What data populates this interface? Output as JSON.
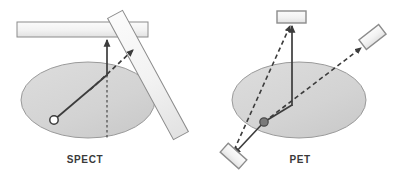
{
  "figure": {
    "title_spect": "SPECT",
    "title_pet": "PET",
    "width": 397,
    "height": 176,
    "background": "#ffffff"
  },
  "colors": {
    "phantom_fill": "#d3d3d3",
    "phantom_stroke": "#9a9a9a",
    "detector_fill": "#f0f0f0",
    "detector_stroke": "#8c8c8c",
    "ray_solid": "#3c3c3c",
    "ray_dashed": "#3c3c3c",
    "source_open_stroke": "#3c3c3c",
    "source_filled": "#6e6e6e",
    "label_text": "#3a3a3a"
  },
  "panels": {
    "spect": {
      "label": "SPECT",
      "label_x": 85,
      "label_y": 163,
      "phantom": {
        "name": "phantom-ellipse",
        "cx": 88,
        "cy": 100,
        "rx": 67,
        "ry": 38
      },
      "source": {
        "name": "point-source-open",
        "cx": 54,
        "cy": 120,
        "r": 4.2,
        "style": "open"
      },
      "collimator_horizontal": {
        "name": "gamma-camera-head-horizontal",
        "x": 17,
        "y": 22,
        "width": 131,
        "height": 15
      },
      "collimator_tilted": {
        "name": "gamma-camera-head-tilted",
        "x1": 114,
        "y1": 12,
        "x2": 182,
        "y2": 138,
        "thickness": 17
      },
      "rays": [
        {
          "name": "emitted-photon-ray-solid",
          "style": "solid",
          "x1": 54,
          "y1": 120,
          "x2": 107,
          "y2": 75,
          "arrow": false
        },
        {
          "name": "accepted-photon-ray-solid-vertical",
          "style": "solid",
          "x1": 107,
          "y1": 75,
          "x2": 107,
          "y2": 40,
          "arrow": true
        },
        {
          "name": "projection-line-dotted-vertical",
          "style": "dotted",
          "x1": 107,
          "y1": 75,
          "x2": 107,
          "y2": 140,
          "arrow": false
        },
        {
          "name": "rejected-photon-ray-dashed",
          "style": "dashed",
          "x1": 92,
          "y1": 88,
          "x2": 134,
          "y2": 49,
          "arrow": true
        }
      ]
    },
    "pet": {
      "label": "PET",
      "label_x": 300,
      "label_y": 163,
      "phantom": {
        "name": "phantom-ellipse",
        "cx": 299,
        "cy": 100,
        "rx": 67,
        "ry": 38
      },
      "source": {
        "name": "annihilation-point-source-filled",
        "cx": 264,
        "cy": 122,
        "r": 4.2,
        "style": "filled"
      },
      "detectors": [
        {
          "name": "detector-top",
          "type": "rect",
          "x": 277,
          "y": 11,
          "width": 29,
          "height": 12,
          "rotation": 0
        },
        {
          "name": "detector-bottom-left",
          "type": "rect",
          "x": 221,
          "y": 150,
          "width": 25,
          "height": 12,
          "rotation": 42
        },
        {
          "name": "detector-upper-right",
          "type": "rect",
          "x": 360,
          "y": 31,
          "width": 25,
          "height": 12,
          "rotation": -38
        }
      ],
      "rays": [
        {
          "name": "annihilation-ray-solid-to-top-detector",
          "style": "solid",
          "x1": 264,
          "y1": 122,
          "x2": 292,
          "y2": 105,
          "arrow": false
        },
        {
          "name": "coincidence-ray-solid-vertical",
          "style": "solid",
          "x1": 292,
          "y1": 105,
          "x2": 292,
          "y2": 26,
          "arrow": true
        },
        {
          "name": "coincidence-ray-solid-to-bottom-left",
          "style": "solid",
          "x1": 264,
          "y1": 122,
          "x2": 234,
          "y2": 155,
          "arrow": true
        },
        {
          "name": "line-of-response-dashed-upper-right",
          "style": "dashed",
          "x1": 264,
          "y1": 122,
          "x2": 362,
          "y2": 47,
          "arrow": true
        },
        {
          "name": "line-of-response-dashed-to-top-detector",
          "style": "dashed",
          "x1": 232,
          "y1": 158,
          "x2": 290,
          "y2": 24,
          "arrow": true
        }
      ]
    }
  }
}
